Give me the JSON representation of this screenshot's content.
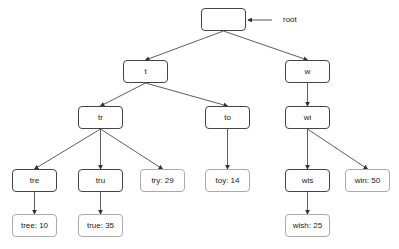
{
  "diagram": {
    "type": "trie",
    "root_label": "root",
    "colors": {
      "edge": "#333333",
      "internal_border": "#444444",
      "leaf_border": "#aaaaaa"
    },
    "nodes": [
      {
        "id": "root",
        "label": "",
        "x": 201,
        "y": 8,
        "leaf": false
      },
      {
        "id": "t",
        "label": "t",
        "x": 123,
        "y": 60,
        "leaf": false
      },
      {
        "id": "w",
        "label": "w",
        "x": 285,
        "y": 60,
        "leaf": false
      },
      {
        "id": "tr",
        "label": "tr",
        "x": 78,
        "y": 106,
        "leaf": false
      },
      {
        "id": "to",
        "label": "to",
        "x": 205,
        "y": 106,
        "leaf": false
      },
      {
        "id": "wi",
        "label": "wi",
        "x": 285,
        "y": 106,
        "leaf": false
      },
      {
        "id": "tre",
        "label": "tre",
        "x": 12,
        "y": 169,
        "leaf": false
      },
      {
        "id": "tru",
        "label": "tru",
        "x": 78,
        "y": 169,
        "leaf": false
      },
      {
        "id": "try",
        "label": "try: 29",
        "x": 140,
        "y": 169,
        "leaf": true
      },
      {
        "id": "toy",
        "label": "toy: 14",
        "x": 205,
        "y": 169,
        "leaf": true
      },
      {
        "id": "wis",
        "label": "wis",
        "x": 285,
        "y": 169,
        "leaf": false
      },
      {
        "id": "win",
        "label": "win: 50",
        "x": 345,
        "y": 169,
        "leaf": true
      },
      {
        "id": "tree",
        "label": "tree: 10",
        "x": 12,
        "y": 214,
        "leaf": true
      },
      {
        "id": "true",
        "label": "true: 35",
        "x": 78,
        "y": 214,
        "leaf": true
      },
      {
        "id": "wish",
        "label": "wish: 25",
        "x": 285,
        "y": 214,
        "leaf": true
      }
    ],
    "edges": [
      [
        "root",
        "t"
      ],
      [
        "root",
        "w"
      ],
      [
        "t",
        "tr"
      ],
      [
        "t",
        "to"
      ],
      [
        "w",
        "wi"
      ],
      [
        "tr",
        "tre"
      ],
      [
        "tr",
        "tru"
      ],
      [
        "tr",
        "try"
      ],
      [
        "to",
        "toy"
      ],
      [
        "wi",
        "wis"
      ],
      [
        "wi",
        "win"
      ],
      [
        "tre",
        "tree"
      ],
      [
        "tru",
        "true"
      ],
      [
        "wis",
        "wish"
      ]
    ]
  }
}
